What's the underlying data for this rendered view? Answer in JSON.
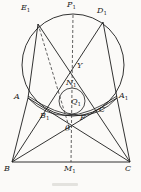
{
  "figure": {
    "type": "geometry-diagram",
    "background": "#fbfaf8",
    "stroke_color": "#1c1c1c",
    "dashed_color": "#3a3a3a",
    "label_color": "#1c1c1c",
    "labels": {
      "E1": {
        "text": "E",
        "sub": "1"
      },
      "P1": {
        "text": "P",
        "sub": "1"
      },
      "D1": {
        "text": "D",
        "sub": "1"
      },
      "A": {
        "text": "A",
        "sub": ""
      },
      "A1": {
        "text": "A",
        "sub": "1"
      },
      "Y": {
        "text": "Y",
        "sub": ""
      },
      "N1": {
        "text": "N",
        "sub": "1"
      },
      "Q1": {
        "text": "Q",
        "sub": "1"
      },
      "B1": {
        "text": "B",
        "sub": "1"
      },
      "C_mid": {
        "text": "C",
        "sub": ""
      },
      "F": {
        "text": "F",
        "sub": ""
      },
      "theta": {
        "text": "θ",
        "sub": ""
      },
      "B": {
        "text": "B",
        "sub": ""
      },
      "M1": {
        "text": "M",
        "sub": "1"
      },
      "C": {
        "text": "C",
        "sub": ""
      }
    }
  }
}
